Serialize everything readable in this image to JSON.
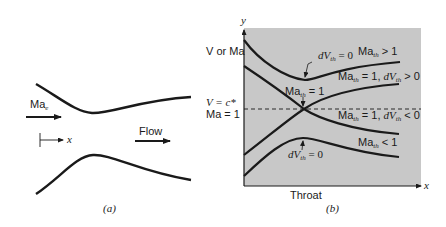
{
  "panel_a": {
    "caption": "(a)",
    "inlet_label_main": "Ma",
    "inlet_label_sub": "e",
    "axis_x_label": "x",
    "flow_label": "Flow"
  },
  "panel_b": {
    "caption": "(b)",
    "y_axis_label": "y",
    "x_axis_label": "x",
    "left_label_top": "V or Ma",
    "left_label_mid_1": "V = c*",
    "left_label_mid_2": "Ma = 1",
    "throat_label": "Throat",
    "curve_labels": {
      "dv_zero_top_main": "dV",
      "dv_zero_top_sub": "th",
      "dv_zero_top_rest": " = 0",
      "ma_gt1_main": "Ma",
      "ma_gt1_sub": "th",
      "ma_gt1_rest": " > 1",
      "ma1_dv_pos_main": "Ma",
      "ma1_dv_pos_sub": "th",
      "ma1_dv_pos_mid": " = 1, ",
      "ma1_dv_pos_dv": "dV",
      "ma1_dv_pos_sub2": "th",
      "ma1_dv_pos_rest": " > 0",
      "ma_eq1_main": "Ma",
      "ma_eq1_sub": "th",
      "ma_eq1_rest": " = 1",
      "ma1_dv_neg_main": "Ma",
      "ma1_dv_neg_sub": "th",
      "ma1_dv_neg_mid": " = 1, ",
      "ma1_dv_neg_dv": "dV",
      "ma1_dv_neg_sub2": "th",
      "ma1_dv_neg_rest": " < 0",
      "ma_lt1_main": "Ma",
      "ma_lt1_sub": "th",
      "ma_lt1_rest": " < 1",
      "dv_zero_bot_main": "dV",
      "dv_zero_bot_sub": "th",
      "dv_zero_bot_rest": " = 0"
    },
    "colors": {
      "plot_background": "#c8c8c8",
      "curve": "#1a1a1a"
    }
  }
}
